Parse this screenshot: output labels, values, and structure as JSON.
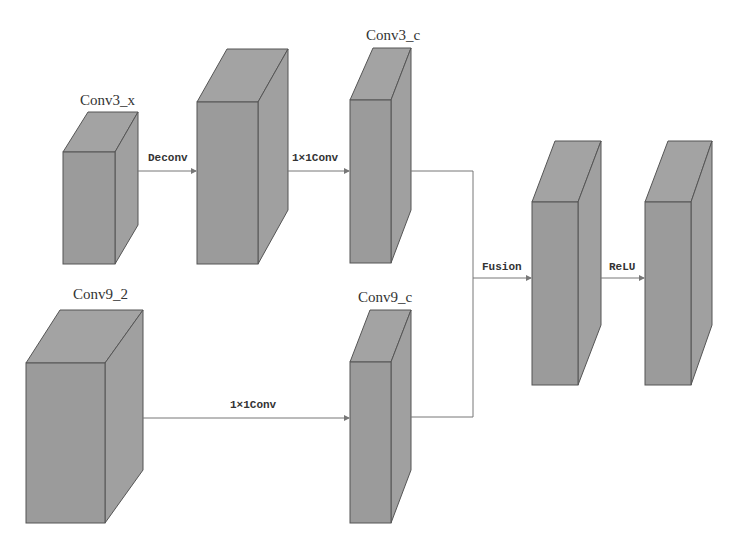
{
  "diagram": {
    "blocks": [
      {
        "id": "conv3_x",
        "label": "Conv3_x"
      },
      {
        "id": "deconv_out",
        "label": ""
      },
      {
        "id": "conv3_c",
        "label": "Conv3_c"
      },
      {
        "id": "conv9_2",
        "label": "Conv9_2"
      },
      {
        "id": "conv9_c",
        "label": "Conv9_c"
      },
      {
        "id": "fusion_out",
        "label": ""
      },
      {
        "id": "relu_out",
        "label": ""
      }
    ],
    "edges": [
      {
        "from": "conv3_x",
        "to": "deconv_out",
        "label": "Deconv"
      },
      {
        "from": "deconv_out",
        "to": "conv3_c",
        "label": "1×1Conv"
      },
      {
        "from": "conv9_2",
        "to": "conv9_c",
        "label": "1×1Conv"
      },
      {
        "from": "conv3_c+conv9_c",
        "to": "fusion_out",
        "label": "Fusion"
      },
      {
        "from": "fusion_out",
        "to": "relu_out",
        "label": "ReLU"
      }
    ]
  }
}
